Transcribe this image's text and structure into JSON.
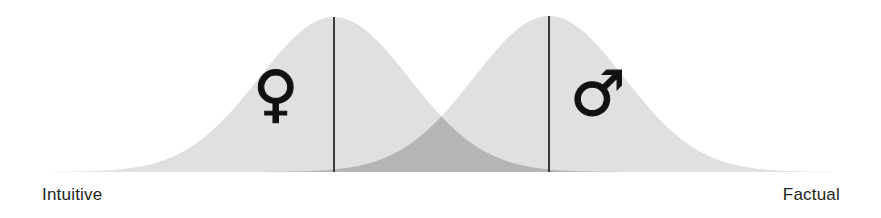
{
  "figure": {
    "width": 881,
    "height": 218,
    "background_color": "#ffffff"
  },
  "axis": {
    "left_label": "Intuitive",
    "right_label": "Factual",
    "label_color": "#231f20",
    "baseline_y": 172
  },
  "markers": {
    "female_symbol": "♀",
    "male_symbol": "♂",
    "symbol_color": "#111111"
  },
  "colors": {
    "curve_fill": "#e0e0e0",
    "overlap_fill": "#b5b5b5",
    "mean_line": "#3a3a3a"
  },
  "chart_data": {
    "type": "area",
    "title": "",
    "subtitle": "",
    "xlabel": "",
    "ylabel": "",
    "xlim": [
      0,
      881
    ],
    "ylim": [
      0,
      172
    ],
    "grid": false,
    "legend_position": "none",
    "x_axis_endpoints": {
      "left": "Intuitive",
      "right": "Factual"
    },
    "series": [
      {
        "name": "Female",
        "symbol": "♀",
        "fill": "#e0e0e0",
        "mean_x": 334,
        "peak_y": 17,
        "spread": 150,
        "tail_start_x": 40,
        "tail_end_x": 640,
        "mean_line_x": 334,
        "symbol_x": 278,
        "symbol_y": 95
      },
      {
        "name": "Male",
        "symbol": "♂",
        "fill": "#e0e0e0",
        "mean_x": 549,
        "peak_y": 16,
        "spread": 150,
        "tail_start_x": 245,
        "tail_end_x": 845,
        "mean_line_x": 549,
        "symbol_x": 596,
        "symbol_y": 95
      }
    ],
    "overlap": {
      "name": "Overlap",
      "fill": "#b5b5b5",
      "crossover_x": 441,
      "crossover_y": 85,
      "left_extent_x": 245,
      "right_extent_x": 845
    },
    "annotations": [
      {
        "text": "Intuitive",
        "x": 42,
        "y": 196,
        "align": "left"
      },
      {
        "text": "Factual",
        "x": 840,
        "y": 196,
        "align": "right"
      }
    ]
  }
}
